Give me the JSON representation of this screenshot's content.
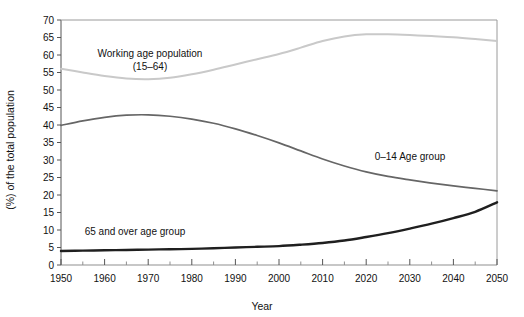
{
  "chart_data": {
    "type": "line",
    "title": "",
    "xlabel": "Year",
    "ylabel": "(%) of the total population",
    "xlim": [
      1950,
      2050
    ],
    "ylim": [
      0,
      70
    ],
    "ytick_step": 5,
    "xtick_step": 10,
    "xminor_step": 5,
    "grid": false,
    "legend_position": "inline-annotations",
    "xticks": [
      "1950",
      "1960",
      "1970",
      "1980",
      "1990",
      "2000",
      "2010",
      "2020",
      "2030",
      "2040",
      "2050"
    ],
    "yticks": [
      "0",
      "5",
      "10",
      "15",
      "20",
      "25",
      "30",
      "35",
      "40",
      "45",
      "50",
      "55",
      "60",
      "65",
      "70"
    ],
    "x": [
      1950,
      1955,
      1960,
      1965,
      1970,
      1975,
      1980,
      1985,
      1990,
      1995,
      2000,
      2005,
      2010,
      2015,
      2020,
      2025,
      2030,
      2035,
      2040,
      2045,
      2050
    ],
    "series": [
      {
        "name": "Working age population (15-64)",
        "color": "#c9c9c9",
        "width": 2.0,
        "style": "solid",
        "annotation": {
          "line1": "Working age population",
          "line2": "(15–64)",
          "x_px": 150,
          "y_px": 57
        },
        "values": [
          56.1,
          55.0,
          54.0,
          53.3,
          53.1,
          53.5,
          54.5,
          55.8,
          57.3,
          58.8,
          60.3,
          62.1,
          64.0,
          65.3,
          65.9,
          65.9,
          65.7,
          65.4,
          65.1,
          64.6,
          64.0
        ]
      },
      {
        "name": "0–14 Age group",
        "color": "#666666",
        "width": 1.7,
        "style": "solid",
        "annotation": {
          "line1": "0–14 Age group",
          "line2": "",
          "x_px": 410,
          "y_px": 160
        },
        "values": [
          39.9,
          41.2,
          42.2,
          42.8,
          42.9,
          42.5,
          41.7,
          40.5,
          38.9,
          37.0,
          34.9,
          32.6,
          30.3,
          28.3,
          26.6,
          25.3,
          24.3,
          23.4,
          22.6,
          21.9,
          21.2
        ]
      },
      {
        "name": "65 and over age group",
        "color": "#1f1f1f",
        "width": 2.4,
        "style": "solid",
        "annotation": {
          "line1": "65 and over age group",
          "line2": "",
          "x_px": 135,
          "y_px": 235
        },
        "values": [
          4.0,
          4.1,
          4.2,
          4.3,
          4.4,
          4.5,
          4.6,
          4.8,
          5.0,
          5.2,
          5.4,
          5.8,
          6.3,
          7.0,
          8.0,
          9.1,
          10.4,
          11.8,
          13.4,
          15.2,
          17.9
        ]
      }
    ]
  }
}
